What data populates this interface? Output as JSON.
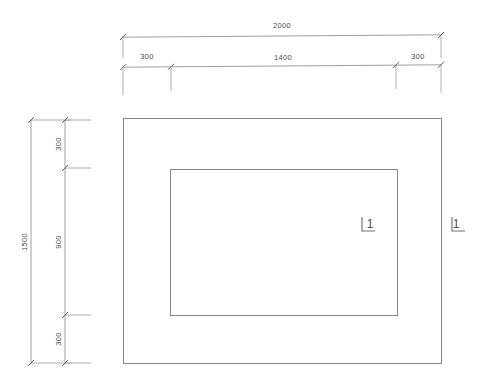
{
  "drawing": {
    "type": "architectural-plan-with-dimensions",
    "background_color": "#ffffff",
    "line_color": "#868686",
    "text_color": "#4a4a4a",
    "units": "mm",
    "shapes": {
      "outer_rectangle": {
        "name": "outer-rectangle",
        "x": 123,
        "y": 118,
        "width": 318,
        "height": 245,
        "overall_width_label": "2000",
        "overall_height_label": "1500"
      },
      "inner_rectangle": {
        "name": "inner-rectangle",
        "x": 170,
        "y": 169,
        "width": 227,
        "height": 146,
        "width_label": "1400",
        "height_label": "900"
      }
    },
    "horizontal_dimensions": {
      "overall": {
        "label": "2000",
        "x_start": 123,
        "x_end": 441,
        "line_y": 36,
        "text_x": 282,
        "text_y": 28
      },
      "chain": {
        "line_y": 66,
        "segments": [
          {
            "label": "300",
            "x_start": 123,
            "x_end": 171,
            "text_x": 147,
            "text_y": 59
          },
          {
            "label": "1400",
            "x_start": 171,
            "x_end": 396,
            "text_x": 283,
            "text_y": 60
          },
          {
            "label": "300",
            "x_start": 396,
            "x_end": 441,
            "text_x": 418,
            "text_y": 59
          }
        ]
      }
    },
    "vertical_dimensions": {
      "overall": {
        "label": "1500",
        "y_start": 120,
        "y_end": 363,
        "line_x": 31,
        "text_x": 27,
        "text_y": 242
      },
      "chain": {
        "line_x": 65,
        "segments": [
          {
            "label": "300",
            "y_start": 120,
            "y_end": 168,
            "text_x": 61,
            "text_y": 144
          },
          {
            "label": "900",
            "y_start": 168,
            "y_end": 315,
            "text_x": 61,
            "text_y": 242
          },
          {
            "label": "300",
            "y_start": 315,
            "y_end": 363,
            "text_x": 61,
            "text_y": 339
          }
        ]
      }
    },
    "section_markers": [
      {
        "name": "section-marker-inner",
        "label": "1",
        "corner_x": 362,
        "corner_y": 231,
        "vertical_leg_length": 14,
        "horizontal_leg_length": 13,
        "text_x": 370,
        "text_y": 228
      },
      {
        "name": "section-marker-outer",
        "label": "1",
        "corner_x": 452,
        "corner_y": 231,
        "vertical_leg_length": 14,
        "horizontal_leg_length": 13,
        "text_x": 456,
        "text_y": 228
      }
    ]
  }
}
